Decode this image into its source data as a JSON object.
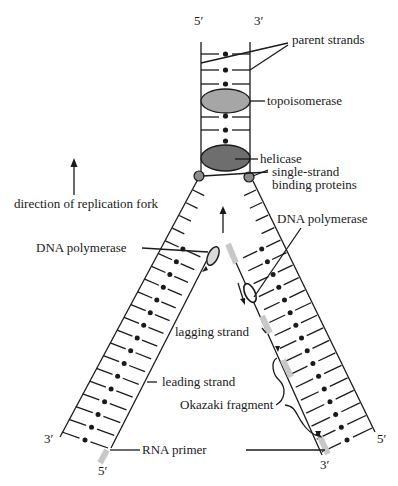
{
  "diagram": {
    "colors": {
      "ink": "#1a1a1a",
      "topoisomerase": "#a6a6a6",
      "helicase": "#6e6e6e",
      "ssb_protein": "#8c8c8c",
      "rna_primer": "#c8c8c8",
      "polymerase": "#d9d9d9"
    },
    "labels": {
      "top_5prime": "5′",
      "top_3prime": "3′",
      "parent_strands": "parent strands",
      "topoisomerase": "topoisomerase",
      "helicase": "helicase",
      "ssb_line1": "single-strand",
      "ssb_line2": "binding proteins",
      "direction": "direction of replication fork",
      "dna_polymerase_left": "DNA polymerase",
      "dna_polymerase_right": "DNA polymerase",
      "lagging_strand": "lagging strand",
      "leading_strand": "leading strand",
      "okazaki_fragment": "Okazaki fragment",
      "rna_primer": "RNA primer",
      "left_3prime": "3′",
      "left_5prime": "5′",
      "right_3prime": "3′",
      "right_5prime": "5′"
    }
  }
}
